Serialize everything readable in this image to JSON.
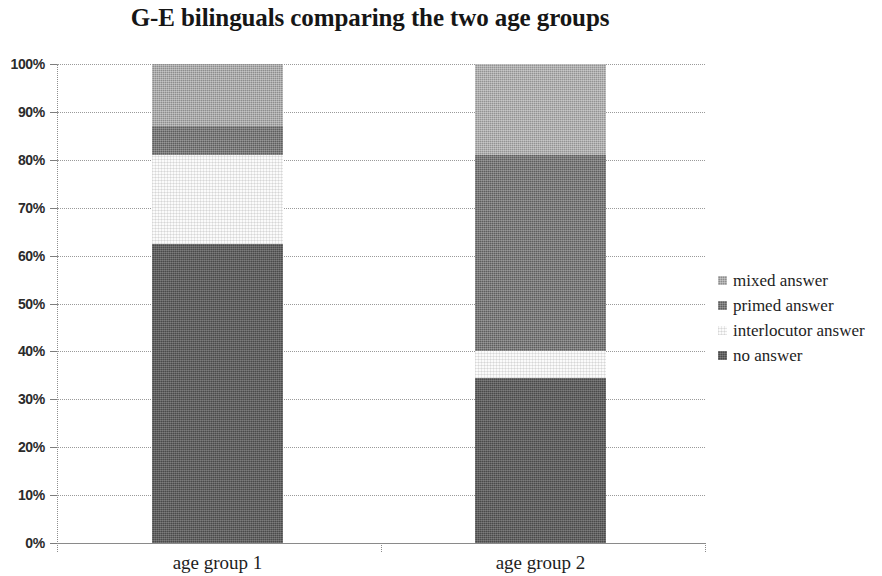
{
  "chart_data": {
    "type": "bar",
    "subtype": "stacked-100-percent",
    "title": "G-E bilinguals comparing the two age groups",
    "xlabel": "",
    "ylabel": "",
    "categories": [
      "age group 1",
      "age group 2"
    ],
    "ylim": [
      0,
      100
    ],
    "ytick_labels": [
      "0%",
      "10%",
      "20%",
      "30%",
      "40%",
      "50%",
      "60%",
      "70%",
      "80%",
      "90%",
      "100%"
    ],
    "ytick_values": [
      0,
      10,
      20,
      30,
      40,
      50,
      60,
      70,
      80,
      90,
      100
    ],
    "grid": true,
    "legend_position": "right",
    "stack_order_bottom_to_top": [
      "no answer",
      "interlocutor answer",
      "primed answer",
      "mixed answer"
    ],
    "series": [
      {
        "name": "no answer",
        "color": "#4a4a4a",
        "values": [
          62.5,
          34.5
        ]
      },
      {
        "name": "interlocutor answer",
        "color": "#fbfbfb",
        "values": [
          18.5,
          5.5
        ]
      },
      {
        "name": "primed answer",
        "color": "#5e5e5e",
        "values": [
          6.0,
          41.0
        ]
      },
      {
        "name": "mixed answer",
        "color": "#8d8d8d",
        "values": [
          13.0,
          19.0
        ]
      }
    ],
    "cumulative_tops_percent": {
      "age group 1": {
        "no answer": 62.5,
        "interlocutor answer": 81.0,
        "primed answer": 87.0,
        "mixed answer": 100.0
      },
      "age group 2": {
        "no answer": 34.5,
        "interlocutor answer": 40.0,
        "primed answer": 81.0,
        "mixed answer": 100.0
      }
    }
  },
  "legend": {
    "items": [
      {
        "label": "mixed answer",
        "swatch": "#8d8d8d"
      },
      {
        "label": "primed answer",
        "swatch": "#5e5e5e"
      },
      {
        "label": "interlocutor answer",
        "swatch": "#fcfcfc"
      },
      {
        "label": "no answer",
        "swatch": "#4a4a4a"
      }
    ]
  }
}
